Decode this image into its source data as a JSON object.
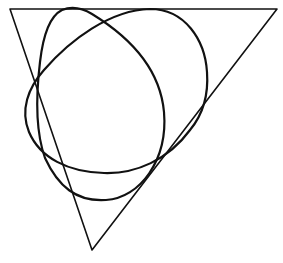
{
  "figure": {
    "background": "#ffffff",
    "stroke_color": "#111111",
    "triangle": {
      "vertices": [
        [
          10,
          9
        ],
        [
          277,
          9
        ],
        [
          92,
          250
        ]
      ],
      "stroke_width": 1.6
    },
    "curves": [
      {
        "name": "tall-oval",
        "stroke_width": 2.2,
        "path": "M 62 10 C 72 6 82 8 92 14 C 128 36 160 68 164 112 C 168 160 140 198 106 200 C 76 202 58 186 45 158 C 35 130 36 95 40 62 C 43 36 50 16 62 10 Z"
      },
      {
        "name": "wide-oval",
        "stroke_width": 2.2,
        "path": "M 150 9 C 185 9 205 40 207 72 C 209 100 200 118 190 130 C 168 160 136 174 104 173 C 68 172 40 158 29 132 C 20 110 28 88 44 70 C 70 40 110 10 150 9 Z"
      }
    ]
  }
}
